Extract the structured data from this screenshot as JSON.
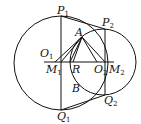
{
  "diagram": {
    "type": "geometry",
    "circles": [
      {
        "name": "circle-1",
        "cx": 61,
        "cy": 64,
        "r": 48
      },
      {
        "name": "circle-2",
        "cx": 103,
        "cy": 62,
        "r": 33
      }
    ],
    "points": {
      "P1": {
        "letter": "P",
        "sub": "1"
      },
      "P2": {
        "letter": "P",
        "sub": "2"
      },
      "A": {
        "letter": "A",
        "sub": ""
      },
      "O1": {
        "letter": "O",
        "sub": "1"
      },
      "M1": {
        "letter": "M",
        "sub": "1"
      },
      "R": {
        "letter": "R",
        "sub": ""
      },
      "O2": {
        "letter": "O",
        "sub": "2"
      },
      "M2": {
        "letter": "M",
        "sub": "2"
      },
      "B": {
        "letter": "B",
        "sub": ""
      },
      "Q1": {
        "letter": "Q",
        "sub": "1"
      },
      "Q2": {
        "letter": "Q",
        "sub": "2"
      }
    }
  }
}
